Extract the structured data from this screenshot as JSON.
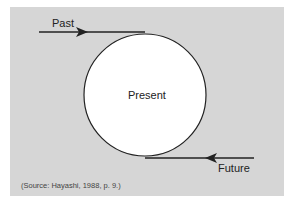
{
  "diagram": {
    "labels": {
      "past": "Past",
      "present": "Present",
      "future": "Future"
    },
    "source": "(Source: Hayashi, 1988, p. 9.)",
    "colors": {
      "background": "#d6d6d6",
      "circle_fill": "#ffffff",
      "stroke": "#222222"
    }
  }
}
